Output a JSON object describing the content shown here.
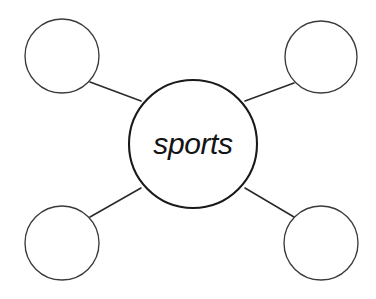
{
  "diagram": {
    "type": "concept-web",
    "title": "sports",
    "background_color": "#ffffff",
    "stroke_color": "#3a3a3a",
    "center_stroke_color": "#1a1a1a",
    "connector_color": "#2b2b2b",
    "text_color": "#141414",
    "center_node": {
      "label": "sports",
      "cx": 193,
      "cy": 144,
      "r": 64
    },
    "satellite_nodes": [
      {
        "name": "top-left",
        "label": "",
        "cx": 62,
        "cy": 56,
        "r": 37
      },
      {
        "name": "top-right",
        "label": "",
        "cx": 321,
        "cy": 57,
        "r": 36
      },
      {
        "name": "bottom-left",
        "label": "",
        "cx": 62,
        "cy": 243,
        "r": 37
      },
      {
        "name": "bottom-right",
        "label": "",
        "cx": 321,
        "cy": 243,
        "r": 37
      }
    ],
    "connectors": [
      {
        "name": "center-to-top-left",
        "x1": 90,
        "y1": 82,
        "x2": 141,
        "y2": 101
      },
      {
        "name": "center-to-top-right",
        "x1": 294,
        "y1": 83,
        "x2": 245,
        "y2": 101
      },
      {
        "name": "center-to-bottom-left",
        "x1": 90,
        "y1": 217,
        "x2": 141,
        "y2": 188
      },
      {
        "name": "center-to-bottom-right",
        "x1": 294,
        "y1": 217,
        "x2": 245,
        "y2": 188
      }
    ]
  }
}
